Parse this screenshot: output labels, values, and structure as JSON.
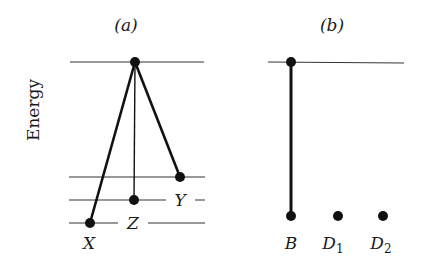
{
  "diagram": {
    "y_axis_label": "Energy",
    "panels": [
      {
        "id": "a",
        "title": "(a)",
        "levels": [
          "top",
          "Y",
          "Z",
          "X"
        ],
        "nodes": [
          {
            "label": "",
            "role": "upper state"
          },
          {
            "label": "X",
            "role": "lowest state"
          },
          {
            "label": "Z",
            "role": "middle state"
          },
          {
            "label": "Y",
            "role": "upper-lower state"
          }
        ],
        "transitions": [
          {
            "from": "top",
            "to": "X",
            "weight": "thick"
          },
          {
            "from": "top",
            "to": "Z",
            "weight": "thin"
          },
          {
            "from": "top",
            "to": "Y",
            "weight": "thick"
          }
        ]
      },
      {
        "id": "b",
        "title": "(b)",
        "levels": [
          "top"
        ],
        "nodes": [
          {
            "label": "",
            "role": "upper state"
          },
          {
            "label": "B",
            "role": "bright state"
          },
          {
            "label": "D",
            "sub": "1",
            "role": "dark state"
          },
          {
            "label": "D",
            "sub": "2",
            "role": "dark state"
          }
        ],
        "transitions": [
          {
            "from": "top",
            "to": "B",
            "weight": "thick"
          }
        ]
      }
    ]
  }
}
